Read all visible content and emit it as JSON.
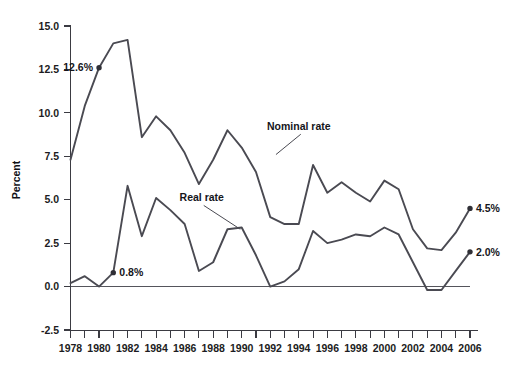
{
  "chart_data": {
    "type": "line",
    "title": "",
    "xlabel": "",
    "ylabel": "Percent",
    "ylim": [
      -2.5,
      15.0
    ],
    "xlim": [
      1978,
      2006
    ],
    "grid": false,
    "legend_position": "inline-annotations",
    "y_ticks": [
      "15.0",
      "12.5",
      "10.0",
      "7.5",
      "5.0",
      "2.5",
      "0.0",
      "-2.5"
    ],
    "y_tick_values": [
      15.0,
      12.5,
      10.0,
      7.5,
      5.0,
      2.5,
      0.0,
      -2.5
    ],
    "x_ticks": [
      "1978",
      "1980",
      "1982",
      "1984",
      "1986",
      "1988",
      "1990",
      "1992",
      "1994",
      "1996",
      "1998",
      "2000",
      "2002",
      "2004",
      "2006"
    ],
    "x_tick_values": [
      1978,
      1980,
      1982,
      1984,
      1986,
      1988,
      1990,
      1992,
      1994,
      1996,
      1998,
      2000,
      2002,
      2004,
      2006
    ],
    "x_all_years": [
      1978,
      1979,
      1980,
      1981,
      1982,
      1983,
      1984,
      1985,
      1986,
      1987,
      1988,
      1989,
      1990,
      1991,
      1992,
      1993,
      1994,
      1995,
      1996,
      1997,
      1998,
      1999,
      2000,
      2001,
      2002,
      2003,
      2004,
      2005,
      2006
    ],
    "zero_line": 0.0,
    "series": [
      {
        "name": "Nominal rate",
        "color": "#4a4a52",
        "x": [
          1978,
          1979,
          1980,
          1981,
          1982,
          1983,
          1984,
          1985,
          1986,
          1987,
          1988,
          1989,
          1990,
          1991,
          1992,
          1993,
          1994,
          1995,
          1996,
          1997,
          1998,
          1999,
          2000,
          2001,
          2002,
          2003,
          2004,
          2005,
          2006
        ],
        "values": [
          7.3,
          10.4,
          12.6,
          14.0,
          14.2,
          8.6,
          9.8,
          9.0,
          7.7,
          5.9,
          7.3,
          9.0,
          8.0,
          6.6,
          4.0,
          3.6,
          3.6,
          7.0,
          5.4,
          6.0,
          5.4,
          4.9,
          6.1,
          5.6,
          3.3,
          2.2,
          2.1,
          3.1,
          4.5
        ]
      },
      {
        "name": "Real rate",
        "color": "#4a4a52",
        "x": [
          1978,
          1979,
          1980,
          1981,
          1982,
          1983,
          1984,
          1985,
          1986,
          1987,
          1988,
          1989,
          1990,
          1991,
          1992,
          1993,
          1994,
          1995,
          1996,
          1997,
          1998,
          1999,
          2000,
          2001,
          2002,
          2003,
          2004,
          2005,
          2006
        ],
        "values": [
          0.2,
          0.6,
          0.0,
          0.8,
          5.8,
          2.9,
          5.1,
          4.4,
          3.6,
          0.9,
          1.4,
          3.3,
          3.4,
          1.8,
          0.0,
          0.3,
          1.0,
          3.2,
          2.5,
          2.7,
          3.0,
          2.9,
          3.4,
          3.0,
          1.4,
          -0.2,
          -0.2,
          0.9,
          2.0
        ]
      }
    ],
    "annotations": [
      {
        "text": "Nominal rate",
        "kind": "series-label",
        "series": "Nominal rate",
        "anchor_x": 1994,
        "anchor_y": 9.0,
        "leader_to_x": 1992.4,
        "leader_to_y": 7.6
      },
      {
        "text": "Real rate",
        "kind": "series-label",
        "series": "Real rate",
        "anchor_x": 1987.2,
        "anchor_y": 4.9,
        "leader_to_x": 1989.9,
        "leader_to_y": 3.3
      },
      {
        "text": "12.6%",
        "kind": "point-label",
        "series": "Nominal rate",
        "point_x": 1980,
        "point_y": 12.6,
        "side": "left"
      },
      {
        "text": "0.8%",
        "kind": "point-label",
        "series": "Real rate",
        "point_x": 1981,
        "point_y": 0.8,
        "side": "right"
      },
      {
        "text": "4.5%",
        "kind": "point-label",
        "series": "Nominal rate",
        "point_x": 2006,
        "point_y": 4.5,
        "side": "right"
      },
      {
        "text": "2.0%",
        "kind": "point-label",
        "series": "Real rate",
        "point_x": 2006,
        "point_y": 2.0,
        "side": "right"
      }
    ]
  },
  "axes": {
    "y_axis_title": "Percent"
  },
  "colors": {
    "line": "#4a4a52",
    "axis": "#3b3b42",
    "text": "#15151b",
    "background": "#ffffff"
  }
}
